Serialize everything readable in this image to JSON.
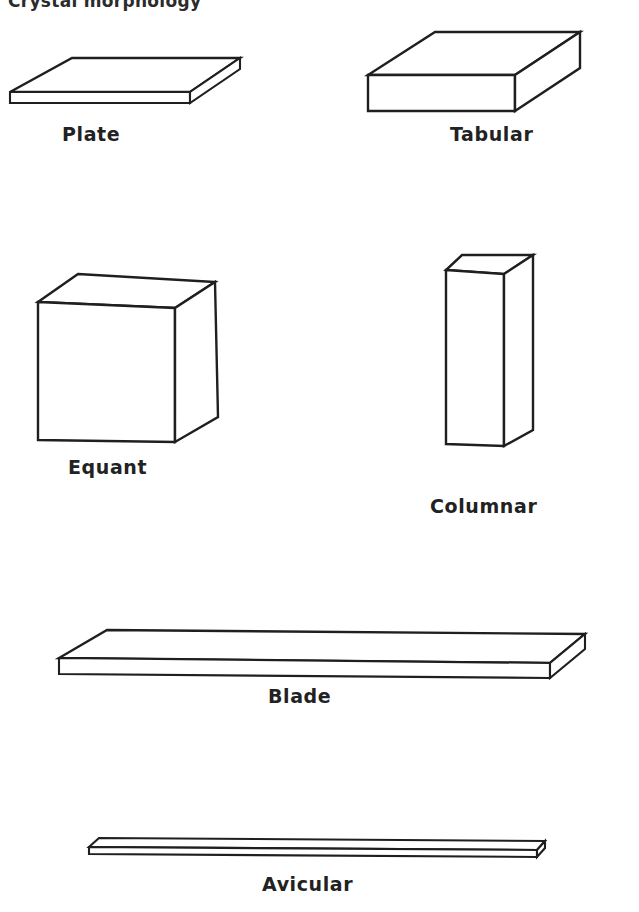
{
  "figure": {
    "title": "Crystal morphology",
    "background_color": "#ffffff",
    "line_color": "#1f1f1f",
    "label_color": "#222222"
  },
  "shapes": [
    {
      "id": "plate",
      "label": "Plate",
      "description": "thin square slab in oblique projection",
      "aspect": "thin tabular, very low thickness"
    },
    {
      "id": "tabular",
      "label": "Tabular",
      "description": "thick rectangular slab in oblique projection",
      "aspect": "moderately thick block, width greater than height"
    },
    {
      "id": "equant",
      "label": "Equant",
      "description": "cube in oblique projection",
      "aspect": "equal dimensions in all directions"
    },
    {
      "id": "columnar",
      "label": "Columnar",
      "description": "tall narrow rectangular prism",
      "aspect": "elongated along one axis"
    },
    {
      "id": "blade",
      "label": "Blade",
      "description": "long thin flat slab",
      "aspect": "elongated and flattened"
    },
    {
      "id": "avicular",
      "label": "Avicular",
      "description": "long very thin sliver",
      "aspect": "extremely elongated and very thin"
    }
  ]
}
